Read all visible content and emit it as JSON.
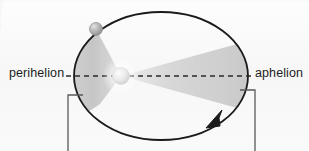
{
  "figure": {
    "name": "kepler-second-law-orbit-diagram",
    "background_color": "#fbfbfb"
  },
  "labels": {
    "perihelion": "perihelion",
    "aphelion": "aphelion"
  },
  "colors": {
    "orbit_stroke": "#1a1a1a",
    "axis_dash": "#2a2a2a",
    "bracket": "#555555",
    "sector_fill_light": "#e4e4e4",
    "sector_fill_dark": "#bcbcbc",
    "sun_fill": "#ededed",
    "planet_fill": "#b6b6b6"
  },
  "geometry": {
    "ellipse": {
      "cx": 161,
      "cy": 76,
      "rx": 87,
      "ry": 64
    },
    "sun": {
      "cx": 121,
      "cy": 76,
      "r": 8.5
    },
    "planet": {
      "cx": 96,
      "cy": 29,
      "r": 6.5
    },
    "axis_line": {
      "x1": 66,
      "y1": 76,
      "x2": 254,
      "y2": 76
    },
    "left_bracket": {
      "stub_x1": 68,
      "stub_x2": 83,
      "stub_y": 95,
      "vert_x": 68,
      "vert_y2": 151
    },
    "right_bracket": {
      "stub_x1": 240,
      "stub_x2": 255,
      "stub_y": 90,
      "vert_x": 255,
      "vert_y2": 151
    },
    "direction_arrow": {
      "x": 215,
      "y": 120,
      "points_counterclockwise": true
    }
  },
  "elements": {
    "sun_name": "sun-at-focus",
    "planet_name": "planet-marker",
    "left_sector_name": "swept-area-sector-near-perihelion",
    "right_sector_name": "swept-area-sector-near-aphelion",
    "orbit_name": "elliptical-orbit-path",
    "arrow_name": "orbit-direction-arrow"
  }
}
